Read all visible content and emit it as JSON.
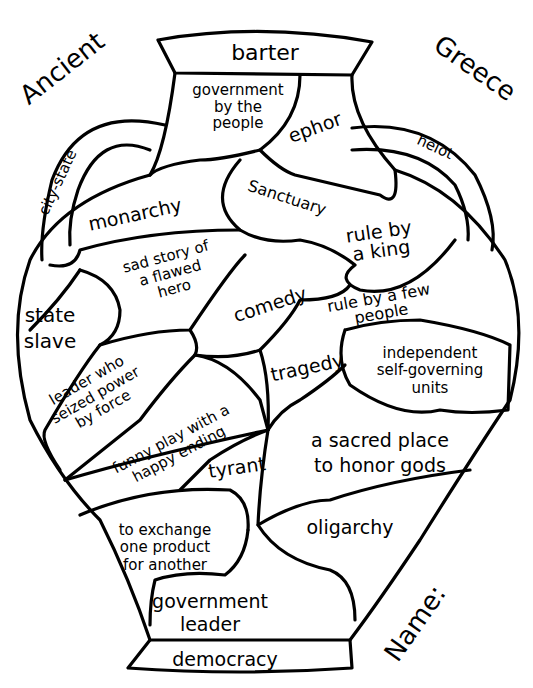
{
  "title": {
    "left": "Ancient",
    "right": "Greece"
  },
  "name_label": "Name:",
  "vase": {
    "rim_label": "barter",
    "base_label": "democracy",
    "left_handle_label": "city-state",
    "right_handle_label": "helot",
    "regions": [
      {
        "id": "government-by-people",
        "text": "government\nby the\npeople"
      },
      {
        "id": "ephor",
        "text": "ephor"
      },
      {
        "id": "monarchy",
        "text": "monarchy"
      },
      {
        "id": "sanctuary",
        "text": "Sanctuary"
      },
      {
        "id": "rule-by-king",
        "text": "rule by\na king"
      },
      {
        "id": "sad-story",
        "text": "sad story of\na flawed\nhero"
      },
      {
        "id": "comedy",
        "text": "comedy"
      },
      {
        "id": "rule-by-few",
        "text": "rule by a few\npeople"
      },
      {
        "id": "state-slave",
        "text": "state\nslave"
      },
      {
        "id": "leader-seized-power",
        "text": "leader who\nseized power\nby force"
      },
      {
        "id": "tragedy",
        "text": "tragedy"
      },
      {
        "id": "independent-units",
        "text": "independent\nself-governing\nunits"
      },
      {
        "id": "funny-play",
        "text": "funny play with a\nhappy ending"
      },
      {
        "id": "tyrant",
        "text": "tyrant"
      },
      {
        "id": "sacred-place",
        "text": "a sacred place\nto honor gods"
      },
      {
        "id": "exchange",
        "text": "to exchange\none product\nfor another"
      },
      {
        "id": "oligarchy",
        "text": "oligarchy"
      },
      {
        "id": "government-leader",
        "text": "government\nleader"
      }
    ]
  }
}
